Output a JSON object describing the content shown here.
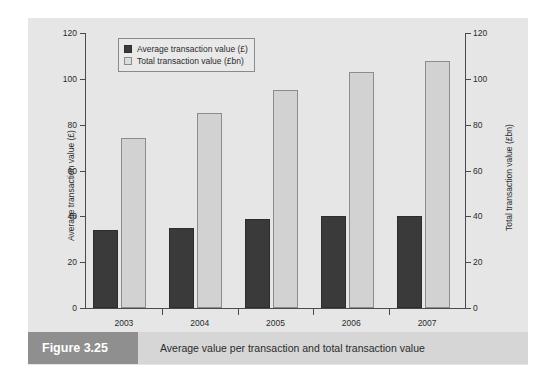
{
  "figure": {
    "tag": "Figure 3.25",
    "caption": "Average value per transaction and total transaction value"
  },
  "legend": {
    "items": [
      {
        "label": "Average transaction value (£)",
        "swatch": "dark",
        "color": "#3a3a3a"
      },
      {
        "label": "Total transaction value (£bn)",
        "swatch": "light",
        "color": "#d2d2d2"
      }
    ]
  },
  "axes": {
    "left_title": "Average transaction value (£)",
    "right_title": "Total transaction value (£bn)",
    "ticks": [
      "0",
      "20",
      "40",
      "60",
      "80",
      "100",
      "120"
    ]
  },
  "chart_data": {
    "type": "bar",
    "title": "Average value per transaction and total transaction value",
    "categories": [
      "2003",
      "2004",
      "2005",
      "2006",
      "2007"
    ],
    "series": [
      {
        "name": "Average transaction value (£)",
        "axis": "left",
        "color": "#3a3a3a",
        "values": [
          34,
          35,
          39,
          40,
          40
        ]
      },
      {
        "name": "Total transaction value (£bn)",
        "axis": "right",
        "color": "#d2d2d2",
        "values": [
          74,
          85,
          95,
          103,
          108
        ]
      }
    ],
    "xlabel": "",
    "ylabel": "Average transaction value (£)",
    "y2label": "Total transaction value (£bn)",
    "ylim": [
      0,
      120
    ],
    "y2lim": [
      0,
      120
    ],
    "yticks": [
      0,
      20,
      40,
      60,
      80,
      100,
      120
    ],
    "grid": false,
    "legend_position": "top-left"
  }
}
